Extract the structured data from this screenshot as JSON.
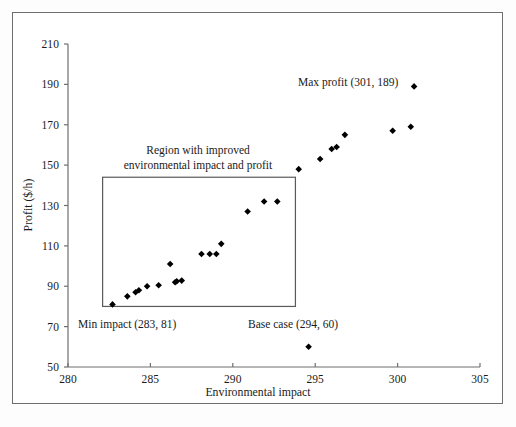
{
  "chart_data": {
    "type": "scatter",
    "title": "",
    "xlabel": "Environmental impact",
    "ylabel": "Profit ($/h)",
    "xlim": [
      280,
      305
    ],
    "ylim": [
      50,
      210
    ],
    "xticks": [
      280,
      285,
      290,
      295,
      300,
      305
    ],
    "yticks": [
      50,
      70,
      90,
      110,
      130,
      150,
      170,
      190,
      210
    ],
    "grid": false,
    "legend": null,
    "marker": "diamond",
    "marker_color": "#000000",
    "series": [
      {
        "name": "Pareto solutions",
        "points": [
          [
            282.7,
            81
          ],
          [
            283.6,
            85
          ],
          [
            284.1,
            87
          ],
          [
            284.3,
            88
          ],
          [
            284.8,
            90
          ],
          [
            285.5,
            90.5
          ],
          [
            286.2,
            101
          ],
          [
            286.5,
            92
          ],
          [
            286.6,
            92.5
          ],
          [
            286.9,
            92.8
          ],
          [
            288.1,
            106
          ],
          [
            288.6,
            106
          ],
          [
            289.0,
            106
          ],
          [
            289.3,
            111
          ],
          [
            290.9,
            127
          ],
          [
            291.9,
            132
          ],
          [
            292.7,
            132
          ],
          [
            294.0,
            148
          ],
          [
            294.6,
            60
          ],
          [
            295.3,
            153
          ],
          [
            296.0,
            158
          ],
          [
            296.3,
            159
          ],
          [
            296.8,
            165
          ],
          [
            299.7,
            167
          ],
          [
            300.8,
            169
          ],
          [
            301.0,
            189
          ]
        ]
      }
    ],
    "annotations": [
      {
        "name": "max-profit",
        "text": "Max profit (301, 189)",
        "data_point": [
          301,
          189
        ]
      },
      {
        "name": "min-impact",
        "text": "Min impact (283, 81)",
        "data_point": [
          283,
          81
        ]
      },
      {
        "name": "base-case",
        "text": "Base case (294, 60)",
        "data_point": [
          294,
          60
        ]
      },
      {
        "name": "region-box",
        "text_line1": "Region with improved",
        "text_line2": "environmental impact and profit",
        "box_x_range": [
          282.1,
          293.8
        ],
        "box_y_range": [
          80,
          144
        ]
      }
    ]
  },
  "axes": {
    "x_title": "Environmental impact",
    "y_title": "Profit ($/h)",
    "x_tick_labels": [
      "280",
      "285",
      "290",
      "295",
      "300",
      "305"
    ],
    "y_tick_labels": [
      "50",
      "70",
      "90",
      "110",
      "130",
      "150",
      "170",
      "190",
      "210"
    ]
  },
  "annotations": {
    "region_line1": "Region with improved",
    "region_line2": "environmental impact and profit",
    "max_profit": "Max profit (301, 189)",
    "min_impact": "Min impact (283, 81)",
    "base_case": "Base case (294, 60)"
  },
  "colors": {
    "marker": "#000000",
    "axis": "#6f6f6f",
    "frame": "#6f6f6f",
    "region_box": "#5a5a5a",
    "background": "#ffffff"
  }
}
